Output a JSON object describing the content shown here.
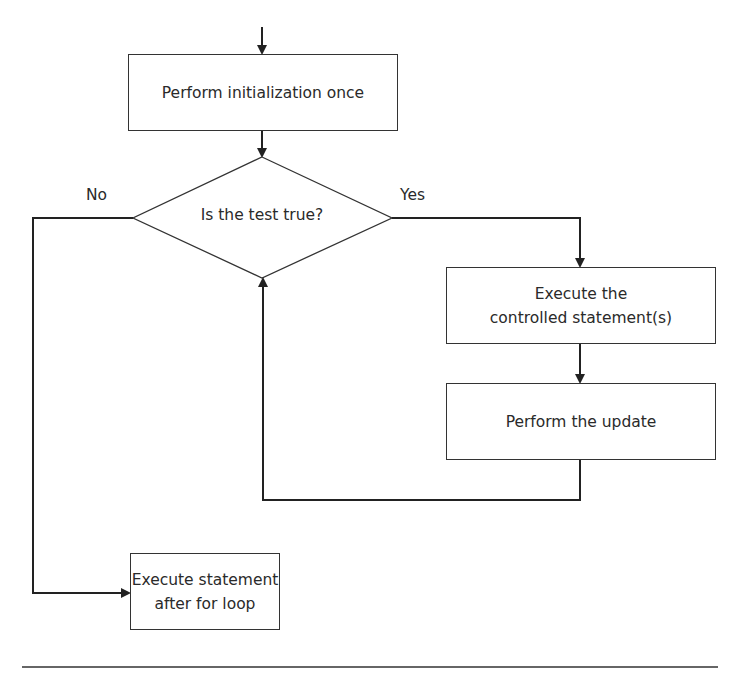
{
  "diagram": {
    "type": "flowchart",
    "nodes": {
      "init": {
        "shape": "process",
        "label": "Perform initialization once"
      },
      "test": {
        "shape": "decision",
        "label": "Is the test true?"
      },
      "body": {
        "shape": "process",
        "lines": [
          "Execute the",
          "controlled statement(s)"
        ]
      },
      "update": {
        "shape": "process",
        "label": "Perform the update"
      },
      "after": {
        "shape": "process",
        "lines": [
          "Execute statement",
          "after for loop"
        ]
      }
    },
    "edge_labels": {
      "no": "No",
      "yes": "Yes"
    },
    "edges": [
      {
        "from": "entry",
        "to": "init"
      },
      {
        "from": "init",
        "to": "test"
      },
      {
        "from": "test",
        "to": "body",
        "label": "Yes"
      },
      {
        "from": "body",
        "to": "update"
      },
      {
        "from": "update",
        "to": "test"
      },
      {
        "from": "test",
        "to": "after",
        "label": "No"
      }
    ],
    "colors": {
      "stroke": "#333333",
      "background": "#ffffff",
      "text": "#2a2a2a"
    }
  }
}
